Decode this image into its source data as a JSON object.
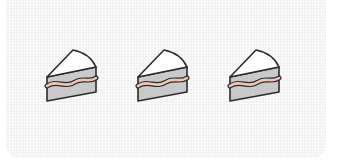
{
  "scene": {
    "description": "Three identical cake slices in a row",
    "background_color": "#f1f1f2",
    "slice_count": 3,
    "colors": {
      "outline": "#2b2b2b",
      "frosting": "#ffffff",
      "sponge": "#c9c9cb",
      "filling": "#f2c4b6"
    }
  },
  "slices": [
    {
      "name": "cake-slice-1",
      "icon": "cake-slice-icon"
    },
    {
      "name": "cake-slice-2",
      "icon": "cake-slice-icon"
    },
    {
      "name": "cake-slice-3",
      "icon": "cake-slice-icon"
    }
  ]
}
